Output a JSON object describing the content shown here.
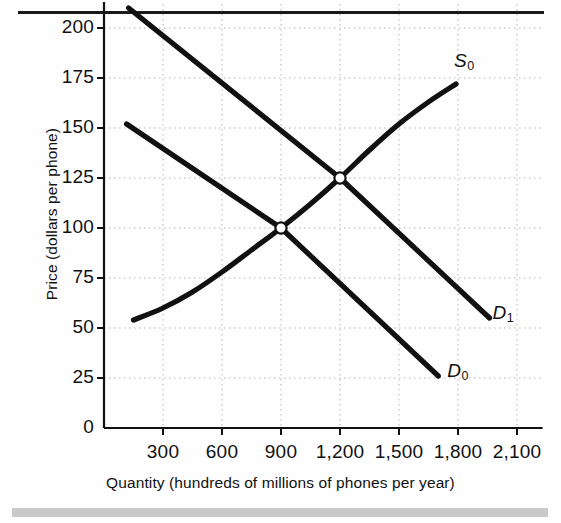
{
  "figure": {
    "name": "supply-and-demand-phones",
    "background_color": "#fefefe",
    "ink_color": "#111111",
    "grid_color": "#b5b5b5",
    "band_color": "#c9c9c9"
  },
  "chart_data": {
    "type": "line",
    "title": "",
    "xlabel": "Quantity (hundreds of millions of phones per year)",
    "ylabel": "Price (dollars per phone)",
    "xlim": [
      0,
      2250
    ],
    "ylim": [
      0,
      215
    ],
    "grid": true,
    "legend_position": "inline-curve-labels",
    "x_ticks": [
      300,
      600,
      900,
      1200,
      1500,
      1800,
      2100
    ],
    "x_tick_labels": [
      "300",
      "600",
      "900",
      "1,200",
      "1,500",
      "1,800",
      "2,100"
    ],
    "y_ticks": [
      0,
      25,
      50,
      75,
      100,
      125,
      150,
      175,
      200
    ],
    "y_tick_labels": [
      "0",
      "25",
      "50",
      "75",
      "100",
      "125",
      "150",
      "175",
      "200"
    ],
    "series": [
      {
        "name": "S0",
        "label": "S",
        "sublabel": "0",
        "kind": "supply",
        "shape": "curve",
        "label_position": {
          "x": 1780,
          "y": 183
        },
        "points": [
          {
            "x": 150,
            "y": 54
          },
          {
            "x": 300,
            "y": 60
          },
          {
            "x": 450,
            "y": 68
          },
          {
            "x": 600,
            "y": 78
          },
          {
            "x": 750,
            "y": 89
          },
          {
            "x": 900,
            "y": 100
          },
          {
            "x": 1050,
            "y": 112
          },
          {
            "x": 1200,
            "y": 125
          },
          {
            "x": 1350,
            "y": 139
          },
          {
            "x": 1500,
            "y": 152
          },
          {
            "x": 1650,
            "y": 163
          },
          {
            "x": 1790,
            "y": 172
          }
        ]
      },
      {
        "name": "D0",
        "label": "D",
        "sublabel": "0",
        "kind": "demand",
        "shape": "line",
        "label_position": {
          "x": 1745,
          "y": 28
        },
        "points": [
          {
            "x": 115,
            "y": 152
          },
          {
            "x": 900,
            "y": 100
          },
          {
            "x": 1700,
            "y": 26
          }
        ]
      },
      {
        "name": "D1",
        "label": "D",
        "sublabel": "1",
        "kind": "demand",
        "shape": "line",
        "label_position": {
          "x": 1975,
          "y": 57
        },
        "points": [
          {
            "x": 125,
            "y": 210
          },
          {
            "x": 1200,
            "y": 125
          },
          {
            "x": 1960,
            "y": 55
          }
        ]
      }
    ],
    "equilibria": [
      {
        "name": "equilibrium-initial",
        "x": 900,
        "y": 100,
        "marker": "open-circle"
      },
      {
        "name": "equilibrium-new",
        "x": 1200,
        "y": 125,
        "marker": "open-circle"
      }
    ],
    "annotations": []
  }
}
